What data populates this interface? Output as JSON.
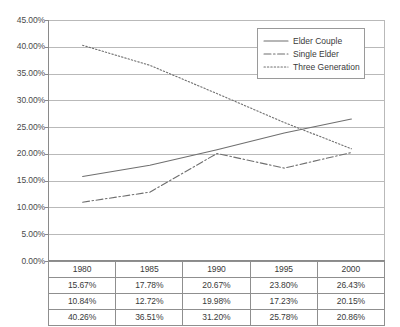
{
  "chart_data": {
    "type": "line",
    "title": "",
    "xlabel": "",
    "ylabel": "",
    "categories": [
      "1980",
      "1985",
      "1990",
      "1995",
      "2000"
    ],
    "ylim": [
      0,
      45
    ],
    "ytick_step": 5,
    "ytick_labels": [
      "45.00%",
      "40.00%",
      "35.00%",
      "30.00%",
      "25.00%",
      "20.00%",
      "15.00%",
      "10.00%",
      "5.00%",
      "0.00%"
    ],
    "ytick_values": [
      45,
      40,
      35,
      30,
      25,
      20,
      15,
      10,
      5,
      0
    ],
    "grid": true,
    "legend_position": "top-right",
    "series": [
      {
        "name": "Elder Couple",
        "style": "solid",
        "color": "#6f6f6f",
        "values": [
          15.67,
          17.78,
          20.67,
          23.8,
          26.43
        ],
        "labels": [
          "15.67%",
          "17.78%",
          "20.67%",
          "23.80%",
          "26.43%"
        ]
      },
      {
        "name": "Single Elder",
        "style": "dash-dot",
        "color": "#6f6f6f",
        "values": [
          10.84,
          12.72,
          19.98,
          17.23,
          20.15
        ],
        "labels": [
          "10.84%",
          "12.72%",
          "19.98%",
          "17.23%",
          "20.15%"
        ]
      },
      {
        "name": "Three Generation",
        "style": "dotted",
        "color": "#6f6f6f",
        "values": [
          40.26,
          36.51,
          31.2,
          25.78,
          20.86
        ],
        "labels": [
          "40.26%",
          "36.51%",
          "31.20%",
          "25.78%",
          "20.86%"
        ]
      }
    ]
  },
  "legend": {
    "items": [
      {
        "label": "Elder Couple",
        "swatch": "solid-line-icon"
      },
      {
        "label": "Single Elder",
        "swatch": "dash-dot-line-icon"
      },
      {
        "label": "Three Generation",
        "swatch": "dotted-line-icon"
      }
    ]
  },
  "table": {
    "header_row": [
      "1980",
      "1985",
      "1990",
      "1995",
      "2000"
    ],
    "rows": [
      [
        "15.67%",
        "17.78%",
        "20.67%",
        "23.80%",
        "26.43%"
      ],
      [
        "10.84%",
        "12.72%",
        "19.98%",
        "17.23%",
        "20.15%"
      ],
      [
        "40.26%",
        "36.51%",
        "31.20%",
        "25.78%",
        "20.86%"
      ]
    ]
  },
  "axis": {
    "y_labels": [
      "45.00%",
      "40.00%",
      "35.00%",
      "30.00%",
      "25.00%",
      "20.00%",
      "15.00%",
      "10.00%",
      "5.00%",
      "0.00%"
    ]
  }
}
